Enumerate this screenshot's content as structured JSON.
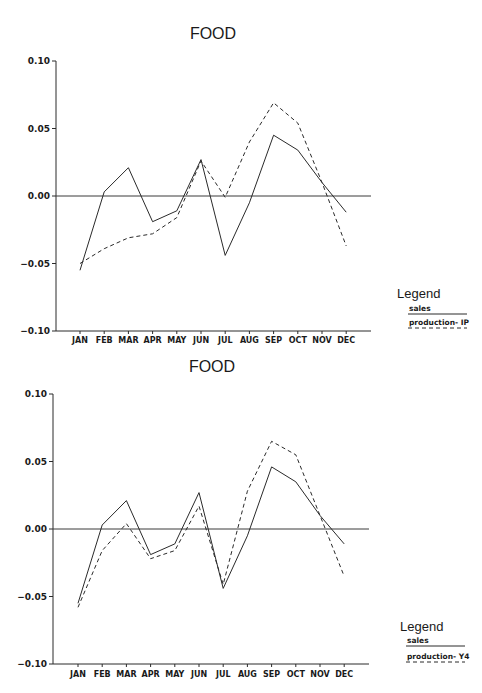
{
  "chart_data": [
    {
      "type": "line",
      "title": "FOOD",
      "xlabel": "",
      "ylabel": "",
      "categories": [
        "JAN",
        "FEB",
        "MAR",
        "APR",
        "MAY",
        "JUN",
        "JUL",
        "AUG",
        "SEP",
        "OCT",
        "NOV",
        "DEC"
      ],
      "ylim": [
        -0.1,
        0.1
      ],
      "yticks": [
        "0.10",
        "0.05",
        "0.00",
        "-0.05",
        "-0.10"
      ],
      "ytick_values": [
        0.1,
        0.05,
        0.0,
        -0.05,
        -0.1
      ],
      "zero_line": true,
      "grid": false,
      "legend": {
        "title": "Legend",
        "placement": "right",
        "entries": [
          "sales",
          "production- IP"
        ]
      },
      "series": [
        {
          "name": "sales",
          "style": "solid",
          "values": [
            -0.055,
            0.003,
            0.021,
            -0.019,
            -0.011,
            0.027,
            -0.044,
            -0.005,
            0.045,
            0.034,
            0.01,
            -0.012
          ]
        },
        {
          "name": "production- IP",
          "style": "dashed",
          "values": [
            -0.05,
            -0.039,
            -0.031,
            -0.028,
            -0.016,
            0.026,
            -0.001,
            0.04,
            0.069,
            0.054,
            0.01,
            -0.037
          ]
        }
      ]
    },
    {
      "type": "line",
      "title": "FOOD",
      "xlabel": "",
      "ylabel": "",
      "categories": [
        "JAN",
        "FEB",
        "MAR",
        "APR",
        "MAY",
        "JUN",
        "JUL",
        "AUG",
        "SEP",
        "OCT",
        "NOV",
        "DEC"
      ],
      "ylim": [
        -0.1,
        0.1
      ],
      "yticks": [
        "0.10",
        "0.05",
        "0.00",
        "-0.05",
        "-0.10"
      ],
      "ytick_values": [
        0.1,
        0.05,
        0.0,
        -0.05,
        -0.1
      ],
      "zero_line": true,
      "grid": false,
      "legend": {
        "title": "Legend",
        "placement": "right",
        "entries": [
          "sales",
          "production- Y4"
        ]
      },
      "series": [
        {
          "name": "sales",
          "style": "solid",
          "values": [
            -0.055,
            0.003,
            0.021,
            -0.019,
            -0.011,
            0.027,
            -0.044,
            -0.005,
            0.046,
            0.035,
            0.01,
            -0.011
          ]
        },
        {
          "name": "production- Y4",
          "style": "dashed",
          "values": [
            -0.058,
            -0.016,
            0.004,
            -0.022,
            -0.016,
            0.017,
            -0.041,
            0.028,
            0.065,
            0.055,
            0.01,
            -0.035
          ]
        }
      ]
    }
  ]
}
